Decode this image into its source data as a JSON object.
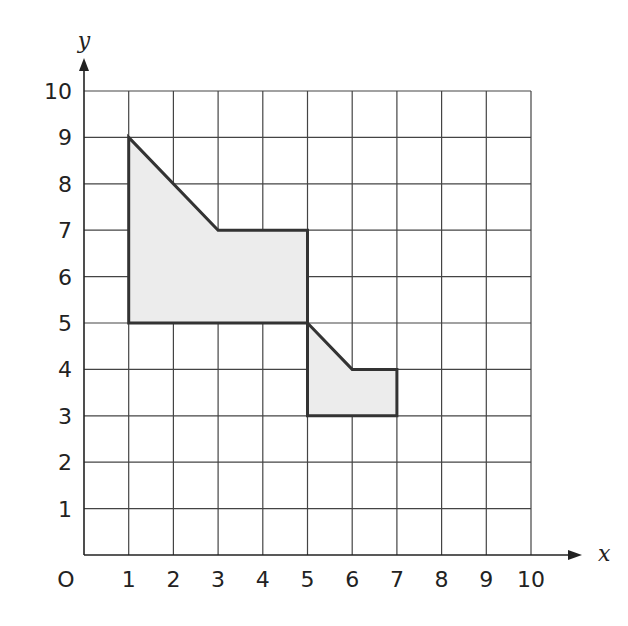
{
  "diagram": {
    "type": "coordinate-grid",
    "x_axis": {
      "label": "x",
      "ticks": [
        "1",
        "2",
        "3",
        "4",
        "5",
        "6",
        "7",
        "8",
        "9",
        "10"
      ],
      "range": [
        0,
        10
      ]
    },
    "y_axis": {
      "label": "y",
      "ticks": [
        "1",
        "2",
        "3",
        "4",
        "5",
        "6",
        "7",
        "8",
        "9",
        "10"
      ],
      "range": [
        0,
        10
      ]
    },
    "origin_label": "O",
    "shapes": [
      {
        "name": "large-shape",
        "vertices": [
          [
            1,
            9
          ],
          [
            3,
            7
          ],
          [
            5,
            7
          ],
          [
            5,
            5
          ],
          [
            1,
            5
          ]
        ],
        "fill": "#ececec",
        "stroke": "#333333"
      },
      {
        "name": "small-shape",
        "vertices": [
          [
            5,
            5
          ],
          [
            6,
            4
          ],
          [
            7,
            4
          ],
          [
            7,
            3
          ],
          [
            5,
            3
          ]
        ],
        "fill": "#ececec",
        "stroke": "#333333"
      }
    ],
    "colors": {
      "grid": "#444444",
      "axis": "#222222",
      "shape_fill": "#ececec",
      "shape_stroke": "#333333"
    }
  }
}
